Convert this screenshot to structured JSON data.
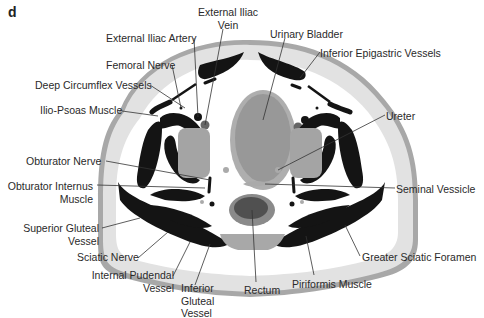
{
  "panel_letter": "d",
  "colors": {
    "skin": "#a8a8a8",
    "fat": "#e2e2e2",
    "muscle": "#141414",
    "bladder_outer": "#aeaeae",
    "bladder_inner": "#989898",
    "rectum_outer": "#8a8a8a",
    "rectum_inner": "#505050",
    "obturator_region": "#a4a4a4",
    "leader_line": "#333333"
  },
  "labels": {
    "external_iliac_vein": [
      "External Iliac",
      "Vein"
    ],
    "external_iliac_artery": "External Iliac Artery",
    "urinary_bladder": "Urinary Bladder",
    "inferior_epigastric_vessels": "Inferior Epigastric Vessels",
    "femoral_nerve": "Femoral Nerve",
    "deep_circumflex_vessels": "Deep Circumflex Vessels",
    "ilio_psoas_muscle": "Ilio-Psoas Muscle",
    "ureter": "Ureter",
    "obturator_nerve": "Obturator Nerve",
    "obturator_internus_muscle": [
      "Obturator Internus",
      "Muscle"
    ],
    "seminal_vessicle": "Seminal Vessicle",
    "superior_gluteal_vessel": [
      "Superior Gluteal",
      "Vessel"
    ],
    "sciatic_nerve": "Sciatic Nerve",
    "greater_sciatic_foramen": "Greater Sciatic Foramen",
    "internal_pudendal_vessel": [
      "Internal Pudendal",
      "Vessel"
    ],
    "inferior_gluteal_vessel": [
      "Inferior",
      "Gluteal",
      "Vessel"
    ],
    "rectum": "Rectum",
    "piriformis_muscle": "Piriformis Muscle"
  }
}
